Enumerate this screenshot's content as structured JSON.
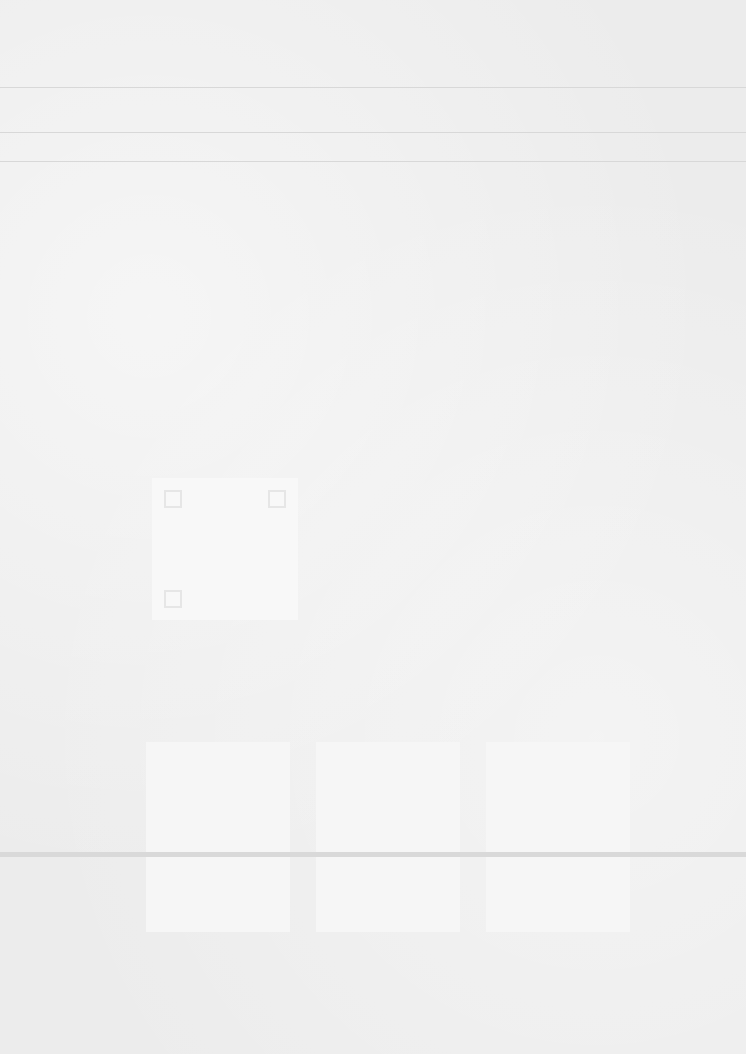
{
  "document": {
    "description": "Blank / heavily faded scanned page; no legible text",
    "header_rules": 3,
    "qr_code_present": true,
    "panels": 3
  }
}
